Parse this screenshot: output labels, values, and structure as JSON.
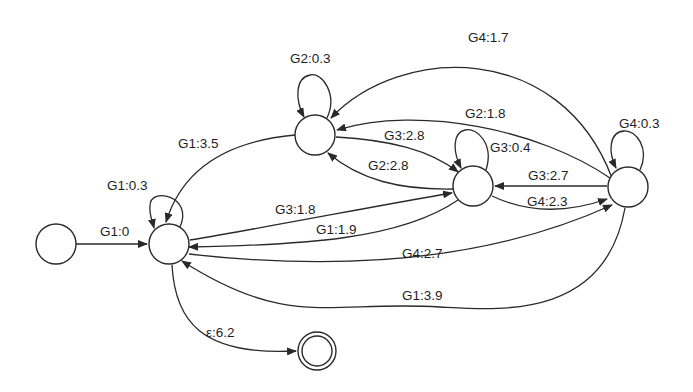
{
  "diagram": {
    "type": "weighted finite-state automaton",
    "colors": {
      "stroke": "#2a2a2a",
      "text": "#1e1e1e",
      "background": "#ffffff"
    },
    "nodes": [
      {
        "id": "start",
        "cx": 56,
        "cy": 244,
        "r": 20,
        "final": false
      },
      {
        "id": "A",
        "cx": 169,
        "cy": 244,
        "r": 20,
        "final": false
      },
      {
        "id": "B",
        "cx": 315,
        "cy": 135,
        "r": 20,
        "final": false
      },
      {
        "id": "C",
        "cx": 473,
        "cy": 186,
        "r": 20,
        "final": false
      },
      {
        "id": "D",
        "cx": 628,
        "cy": 187,
        "r": 20,
        "final": false
      },
      {
        "id": "F",
        "cx": 317,
        "cy": 351,
        "r": 19,
        "final": true
      }
    ],
    "edges": [
      {
        "from": "start",
        "to": "A",
        "label": "G1:0",
        "path": "M76,244 L147,244",
        "lx": 100,
        "ly": 236
      },
      {
        "from": "A",
        "to": "A",
        "label": "G1:0.3",
        "path": "M180,227 C194,196 150,186 150,206 C149,214 152,220 154,228",
        "lx": 107,
        "ly": 190
      },
      {
        "from": "B",
        "to": "A",
        "label": "G1:3.5",
        "path": "M295,135 C240,140 185,160 166,222",
        "lx": 178,
        "ly": 148
      },
      {
        "from": "B",
        "to": "B",
        "label": "G2:0.3",
        "path": "M327,118 C338,94 322,72 310,75 C295,78 295,100 304,117",
        "lx": 290,
        "ly": 63
      },
      {
        "from": "D",
        "to": "B",
        "label": "G4:1.7",
        "path": "M612,178 C560,40 400,45 331,118",
        "lx": 468,
        "ly": 42
      },
      {
        "from": "D",
        "to": "B",
        "label": "G2:1.8",
        "path": "M610,178 C540,130 420,105 337,130",
        "lx": 465,
        "ly": 118
      },
      {
        "from": "B",
        "to": "C",
        "label": "G3:2.8",
        "path": "M336,137 C390,140 430,150 458,172",
        "lx": 384,
        "ly": 140
      },
      {
        "from": "C",
        "to": "B",
        "label": "G2:2.8",
        "path": "M453,189 C400,190 360,180 328,153",
        "lx": 368,
        "ly": 170
      },
      {
        "from": "C",
        "to": "C",
        "label": "G3:0.4",
        "path": "M486,170 C494,145 478,127 465,130 C452,133 453,152 461,168",
        "lx": 490,
        "ly": 152
      },
      {
        "from": "A",
        "to": "C",
        "label": "G3:1.8",
        "path": "M190,240 C280,225 380,205 452,193",
        "lx": 275,
        "ly": 214
      },
      {
        "from": "C",
        "to": "A",
        "label": "G1:1.9",
        "path": "M458,200 C400,240 300,245 189,247",
        "lx": 316,
        "ly": 234
      },
      {
        "from": "D",
        "to": "C",
        "label": "G3:2.7",
        "path": "M607,186 L495,186",
        "lx": 528,
        "ly": 180
      },
      {
        "from": "C",
        "to": "D",
        "label": "G4:2.3",
        "path": "M492,196 C530,214 570,212 607,199",
        "lx": 527,
        "ly": 206
      },
      {
        "from": "D",
        "to": "D",
        "label": "G4:0.3",
        "path": "M640,170 C650,148 636,130 624,131 C609,132 608,152 616,168",
        "lx": 619,
        "ly": 128
      },
      {
        "from": "A",
        "to": "D",
        "label": "G4:2.7",
        "path": "M189,254 C330,270 480,265 612,205",
        "lx": 402,
        "ly": 258
      },
      {
        "from": "D",
        "to": "A",
        "label": "G1:3.9",
        "path": "M625,208 C605,320 500,310 440,307 C330,300 290,330 182,261",
        "lx": 402,
        "ly": 300
      },
      {
        "from": "A",
        "to": "F",
        "label": "ε:6.2",
        "path": "M172,265 C175,320 200,356 296,351",
        "lx": 206,
        "ly": 337
      }
    ]
  }
}
